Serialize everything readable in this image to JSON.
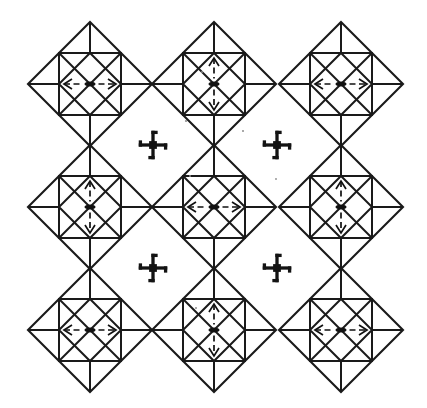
{
  "figure": {
    "width": 427,
    "height": 408,
    "background_color": "#ffffff",
    "line_color": "#1a1a1a",
    "symbol_color": "#131313"
  },
  "lattice": {
    "columns": 3,
    "rows": 3,
    "center_x": [
      90,
      214,
      341
    ],
    "center_y": [
      84,
      207,
      330
    ],
    "square_half": 31,
    "flap_height": 31,
    "outline_stroke": 2.1,
    "inner_stroke": 2.0
  },
  "motifs": [
    {
      "id": "motif-r1c1",
      "name": "star-motif-top-left",
      "row": 0,
      "col": 0,
      "cx": 90,
      "cy": 84,
      "axis": "horizontal",
      "axis_symbol": "two-fold-axis-horizontal"
    },
    {
      "id": "motif-r1c2",
      "name": "star-motif-top-center",
      "row": 0,
      "col": 1,
      "cx": 214,
      "cy": 84,
      "axis": "vertical",
      "axis_symbol": "two-fold-axis-vertical"
    },
    {
      "id": "motif-r1c3",
      "name": "star-motif-top-right",
      "row": 0,
      "col": 2,
      "cx": 341,
      "cy": 84,
      "axis": "horizontal",
      "axis_symbol": "two-fold-axis-horizontal"
    },
    {
      "id": "motif-r2c1",
      "name": "star-motif-middle-left",
      "row": 1,
      "col": 0,
      "cx": 90,
      "cy": 207,
      "axis": "vertical",
      "axis_symbol": "two-fold-axis-vertical"
    },
    {
      "id": "motif-r2c2",
      "name": "star-motif-middle-center",
      "row": 1,
      "col": 1,
      "cx": 214,
      "cy": 207,
      "axis": "horizontal",
      "axis_symbol": "two-fold-axis-horizontal"
    },
    {
      "id": "motif-r2c3",
      "name": "star-motif-middle-right",
      "row": 1,
      "col": 2,
      "cx": 341,
      "cy": 207,
      "axis": "vertical",
      "axis_symbol": "two-fold-axis-vertical"
    },
    {
      "id": "motif-r3c1",
      "name": "star-motif-bottom-left",
      "row": 2,
      "col": 0,
      "cx": 90,
      "cy": 330,
      "axis": "horizontal",
      "axis_symbol": "two-fold-axis-horizontal"
    },
    {
      "id": "motif-r3c2",
      "name": "star-motif-bottom-center",
      "row": 2,
      "col": 1,
      "cx": 214,
      "cy": 330,
      "axis": "vertical",
      "axis_symbol": "two-fold-axis-vertical"
    },
    {
      "id": "motif-r3c3",
      "name": "star-motif-bottom-right",
      "row": 2,
      "col": 2,
      "cx": 341,
      "cy": 330,
      "axis": "horizontal",
      "axis_symbol": "two-fold-axis-horizontal"
    }
  ],
  "pinwheels": [
    {
      "id": "pinwheel-1",
      "name": "four-fold-rotation-symbol-upper-left",
      "cx": 153,
      "cy": 145,
      "size": 15,
      "rotation": 0
    },
    {
      "id": "pinwheel-2",
      "name": "four-fold-rotation-symbol-upper-right",
      "cx": 277,
      "cy": 145,
      "size": 15,
      "rotation": 0
    },
    {
      "id": "pinwheel-3",
      "name": "four-fold-rotation-symbol-lower-left",
      "cx": 153,
      "cy": 268,
      "size": 15,
      "rotation": 0
    },
    {
      "id": "pinwheel-4",
      "name": "four-fold-rotation-symbol-lower-right",
      "cx": 277,
      "cy": 268,
      "size": 15,
      "rotation": 0
    }
  ],
  "axis_symbol_spec": {
    "arm_length": 26,
    "head_length": 8,
    "head_spread": 5,
    "lens_width": 11,
    "lens_height": 5,
    "gap": 3
  },
  "specks": [
    {
      "id": "speck-1",
      "cx": 186,
      "cy": 121,
      "r": 1.1
    },
    {
      "id": "speck-2",
      "cx": 243,
      "cy": 131,
      "r": 1.0
    },
    {
      "id": "speck-3",
      "cx": 190,
      "cy": 176,
      "r": 1.0
    },
    {
      "id": "speck-4",
      "cx": 276,
      "cy": 179,
      "r": 0.9
    },
    {
      "id": "speck-5",
      "cx": 196,
      "cy": 308,
      "r": 1.0
    },
    {
      "id": "speck-6",
      "cx": 202,
      "cy": 72,
      "r": 1.0
    }
  ]
}
